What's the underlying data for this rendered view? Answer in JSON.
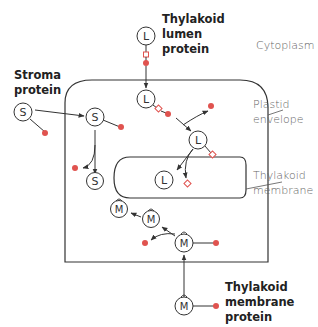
{
  "colors": {
    "line": "#333333",
    "accent": "#e0534f",
    "background": "#ffffff",
    "label_dark": "#222222",
    "label_light": "#666666"
  },
  "labels": {
    "stroma_protein": "Stroma\nprotein",
    "lumen_protein": "Thylakoid\nlumen\nprotein",
    "membrane_protein": "Thylakoid\nmembrane\nprotein",
    "cytoplasm": "Cytoplasm",
    "plastid_envelope": "Plastid\nenvelope",
    "thylakoid_membrane": "Thylakoid\nmembrane"
  },
  "nodes": {
    "stroma": "S",
    "lumen": "L",
    "membrane": "M"
  },
  "diagram": {
    "compartments": [
      "Cytoplasm",
      "Plastid envelope",
      "Stroma",
      "Thylakoid membrane",
      "Thylakoid lumen"
    ],
    "pathways": [
      {
        "protein": "Stroma protein",
        "steps": [
          "S + signal (cytoplasm)",
          "S + signal (stroma)",
          "S mature + cleaved signal"
        ]
      },
      {
        "protein": "Thylakoid lumen protein",
        "steps": [
          "L + 2 signals (cytoplasm)",
          "L + 2 signals (stroma)",
          "L + lumen signal",
          "L mature in lumen + cleaved signal"
        ]
      },
      {
        "protein": "Thylakoid membrane protein",
        "steps": [
          "M + signal (cytoplasm)",
          "M + signal (stroma)",
          "M (stroma)",
          "M inserted in thylakoid membrane"
        ]
      }
    ]
  }
}
